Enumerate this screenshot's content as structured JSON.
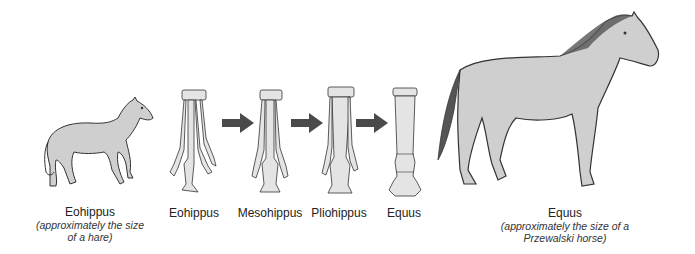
{
  "diagram": {
    "type": "horse-evolution",
    "colors": {
      "body_fill": "#cfcfcf",
      "outline": "#333333",
      "arrow": "#4a4a4a",
      "bone_fill": "#e4e4e4"
    },
    "left_animal": {
      "name": "Eohippus",
      "caption": "(approximately the size of a hare)",
      "caption_line1": "(approximately the size",
      "caption_line2": "of a hare)"
    },
    "feet": [
      {
        "name": "Eohippus",
        "toes": 4
      },
      {
        "name": "Mesohippus",
        "toes": 3
      },
      {
        "name": "Pliohippus",
        "toes": 3
      },
      {
        "name": "Equus",
        "toes": 1
      }
    ],
    "arrows": [
      "arrow-1",
      "arrow-2",
      "arrow-3"
    ],
    "right_animal": {
      "name": "Equus",
      "caption": "(approximately the size of a Przewalski horse)",
      "caption_line1": "(approximately the size of a",
      "caption_line2": "Przewalski horse)"
    }
  }
}
